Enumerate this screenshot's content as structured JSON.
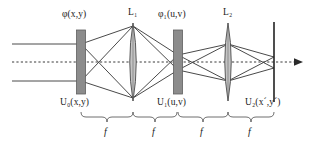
{
  "figure": {
    "background_color": "#ffffff",
    "line_color": "#3a3a3a",
    "plate_fill": "#8c8c8c",
    "plate_stroke": "#5a5a5a",
    "lens_fill": "#bfbfbf",
    "lens_stroke": "#4a4a4a",
    "axis_style": "dotted",
    "width": 313,
    "height": 145
  },
  "top_labels": [
    {
      "id": "phi-xy",
      "text": "φ(x,y)",
      "x": 62,
      "y": 10
    },
    {
      "id": "lens1",
      "text": "L₁",
      "x": 127,
      "y": 8
    },
    {
      "id": "phi1-uv",
      "text": "φ₁(u,v)",
      "x": 160,
      "y": 10
    },
    {
      "id": "lens2",
      "text": "L₂",
      "x": 222,
      "y": 8
    }
  ],
  "bottom_labels": [
    {
      "id": "u0-xy",
      "text": "U₀(x,y)",
      "x": 61,
      "y": 98
    },
    {
      "id": "u1-uv",
      "text": "U₁(u,v)",
      "x": 159,
      "y": 98
    },
    {
      "id": "u2-xpyp",
      "text": "U₂(x´,y´)",
      "x": 247,
      "y": 98
    }
  ],
  "distance_labels": [
    {
      "id": "f1",
      "text": "f",
      "x": 98,
      "y": 128
    },
    {
      "id": "f2",
      "text": "f",
      "x": 145,
      "y": 128
    },
    {
      "id": "f3",
      "text": "f",
      "x": 199,
      "y": 128
    },
    {
      "id": "f4",
      "text": "f",
      "x": 247,
      "y": 128
    }
  ],
  "elements": [
    {
      "id": "object-plate",
      "kind": "plate",
      "name": "phi-xy-plate",
      "x": 81,
      "top": 30,
      "bottom": 94,
      "thickness": 9
    },
    {
      "id": "lens-1",
      "kind": "lens",
      "name": "lens-L1",
      "x": 133,
      "top": 23,
      "bottom": 101,
      "halfwidth": 5
    },
    {
      "id": "filter-plate",
      "kind": "plate",
      "name": "phi1-uv-plate",
      "x": 178,
      "top": 30,
      "bottom": 94,
      "thickness": 9
    },
    {
      "id": "lens-2",
      "kind": "lens",
      "name": "lens-L2",
      "x": 228,
      "top": 23,
      "bottom": 101,
      "halfwidth": 5
    },
    {
      "id": "output-plane",
      "kind": "line",
      "name": "output-plane",
      "x": 274,
      "top": 22,
      "bottom": 102
    }
  ],
  "axis": {
    "y": 62,
    "x_start": 12,
    "x_end": 302,
    "arrow": true
  },
  "rays": {
    "upper_input_y": 44,
    "lower_input_y": 81,
    "input_x_start": 12,
    "focus_upper_y": 55,
    "focus_lower_y": 70
  },
  "braces": [
    {
      "id": "brace-1",
      "x1": 81,
      "x2": 133,
      "y": 114
    },
    {
      "id": "brace-2",
      "x1": 133,
      "x2": 178,
      "y": 114
    },
    {
      "id": "brace-3",
      "x1": 178,
      "x2": 228,
      "y": 114
    },
    {
      "id": "brace-4",
      "x1": 228,
      "x2": 274,
      "y": 114
    }
  ]
}
